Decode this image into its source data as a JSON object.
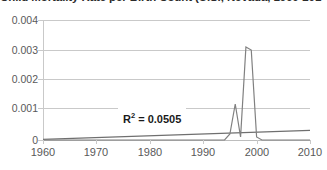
{
  "chart_data": {
    "type": "line",
    "title": "Child Mortality Rate per Birth Count (U.S., Nevada, 1960-2010)",
    "xlabel": "",
    "ylabel": "",
    "xlim": [
      1960,
      2010
    ],
    "ylim": [
      0,
      0.004
    ],
    "grid": true,
    "legend": false,
    "ytick_labels": [
      "0.004",
      "0.003",
      "0.002",
      "0.001",
      "0"
    ],
    "ytick_values": [
      0.004,
      0.003,
      0.002,
      0.001,
      0
    ],
    "xtick_labels": [
      "1960",
      "1970",
      "1980",
      "1990",
      "2000",
      "2010"
    ],
    "xtick_values": [
      1960,
      1970,
      1980,
      1990,
      2000,
      2010
    ],
    "annotations": [
      {
        "name": "r-squared",
        "text": "R",
        "sup": "2",
        "tail": " = 0.0505",
        "value": 0.0505
      }
    ],
    "series": [
      {
        "name": "data",
        "color": "#808080",
        "x": [
          1960,
          1961,
          1962,
          1963,
          1964,
          1965,
          1966,
          1967,
          1968,
          1969,
          1970,
          1971,
          1972,
          1973,
          1974,
          1975,
          1976,
          1977,
          1978,
          1979,
          1980,
          1981,
          1982,
          1983,
          1984,
          1985,
          1986,
          1987,
          1988,
          1989,
          1990,
          1991,
          1992,
          1993,
          1994,
          1995,
          1996,
          1997,
          1998,
          1999,
          2000,
          2001,
          2002,
          2003,
          2004,
          2005,
          2006,
          2007,
          2008,
          2009,
          2010
        ],
        "values": [
          0,
          0,
          0,
          0,
          0,
          0,
          0,
          0,
          0,
          0,
          0,
          0,
          0,
          0,
          0,
          0,
          0,
          0,
          0,
          0,
          0,
          0,
          0,
          0,
          0,
          0,
          0,
          0,
          0,
          0,
          0,
          0,
          0,
          0,
          0,
          0.0002,
          0.0012,
          0.0001,
          0.0031,
          0.003,
          0.0001,
          0,
          0,
          0,
          0,
          0,
          0,
          0,
          0,
          0,
          0
        ]
      },
      {
        "name": "linear-trend",
        "color": "#6f6f6f",
        "x": [
          1960,
          2010
        ],
        "values": [
          2e-05,
          0.00032
        ]
      }
    ]
  },
  "axes": {
    "y_labels": [
      "0.004",
      "0.003",
      "0.002",
      "0.001",
      "0"
    ],
    "x_labels": [
      "1960",
      "1970",
      "1980",
      "1990",
      "2000",
      "2010"
    ]
  },
  "annotation": {
    "r2_prefix": "R",
    "r2_sup": "2",
    "r2_value": " = 0.0505",
    "r2_full": "R2 = 0.0505"
  },
  "title": {
    "text": "Child Mortality Rate per Birth Count (U.S., Nevada, 1960-2010)"
  },
  "colors": {
    "series": "#808080",
    "trend": "#6f6f6f",
    "grid": "#c9c9c9",
    "text": "#595959",
    "background": "#ffffff"
  }
}
